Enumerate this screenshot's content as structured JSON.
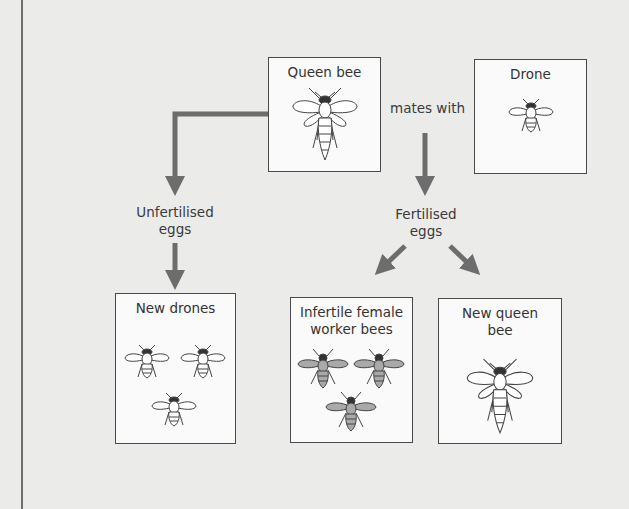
{
  "diagram": {
    "boxes": {
      "queen": {
        "label": "Queen bee"
      },
      "drone": {
        "label": "Drone"
      },
      "new_drones": {
        "label": "New drones"
      },
      "workers": {
        "label": "Infertile female worker bees"
      },
      "new_queen": {
        "label": "New queen bee"
      }
    },
    "edge_labels": {
      "mates_with": "mates with",
      "unfertilised": "Unfertilised eggs",
      "fertilised": "Fertilised eggs"
    },
    "edges": [
      {
        "from": "queen",
        "to": "unfertilised_eggs"
      },
      {
        "from": "unfertilised_eggs",
        "to": "new_drones"
      },
      {
        "from": "queen+drone (mates with)",
        "to": "fertilised_eggs"
      },
      {
        "from": "fertilised_eggs",
        "to": "workers"
      },
      {
        "from": "fertilised_eggs",
        "to": "new_queen"
      }
    ],
    "colors": {
      "arrow": "#6d6d6d",
      "box_border": "#4a4a4a",
      "box_fill": "#fafafa",
      "background": "#ebebea",
      "worker_fill": "#a9a9a9"
    }
  }
}
